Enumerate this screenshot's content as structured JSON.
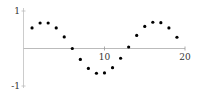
{
  "chart_data": {
    "type": "scatter",
    "title": "",
    "xlabel": "",
    "ylabel": "",
    "xlim": [
      0,
      20
    ],
    "ylim": [
      -1,
      1
    ],
    "grid": false,
    "legend": null,
    "x_ticks": [
      10,
      20
    ],
    "x_tick_labels": [
      "10",
      "20"
    ],
    "y_ticks": [
      1,
      -1
    ],
    "y_tick_labels": [
      "1",
      "-1"
    ],
    "series": [
      {
        "name": "points",
        "x": [
          1,
          2,
          3,
          4,
          5,
          6,
          7,
          8,
          9,
          10,
          11,
          12,
          13,
          14,
          15,
          16,
          17,
          18,
          19
        ],
        "y": [
          0.55,
          0.68,
          0.68,
          0.55,
          0.31,
          0.0,
          -0.29,
          -0.53,
          -0.66,
          -0.65,
          -0.51,
          -0.26,
          0.04,
          0.35,
          0.59,
          0.7,
          0.69,
          0.55,
          0.3
        ]
      }
    ],
    "colors": {
      "points": "#000000",
      "axis": "#bbbbbb",
      "labels": "#333333"
    }
  }
}
